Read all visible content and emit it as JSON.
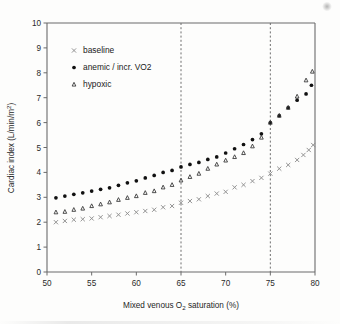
{
  "chart_data": {
    "type": "scatter",
    "title": "",
    "xlabel": "Mixed venous O2 saturation (%)",
    "ylabel": "Cardiac index (L/min/m2)",
    "xlim": [
      50,
      80
    ],
    "ylim": [
      0,
      10
    ],
    "xticks": [
      50,
      55,
      60,
      65,
      70,
      75,
      80
    ],
    "xticklabels": [
      "50",
      "55",
      "60",
      "65",
      "70",
      "75",
      "80"
    ],
    "yticks": [
      0,
      1,
      2,
      3,
      4,
      5,
      6,
      7,
      8,
      9,
      10
    ],
    "yticklabels": [
      "0",
      "1",
      "2",
      "3",
      "4",
      "5",
      "6",
      "7",
      "8",
      "9",
      "10"
    ],
    "grid": false,
    "legend_position": "upper left",
    "annotations": [
      {
        "type": "vline",
        "x": 65,
        "style": "dashed"
      },
      {
        "type": "vline",
        "x": 75,
        "style": "dashed"
      }
    ],
    "series": [
      {
        "name": "baseline",
        "marker": "x",
        "color": "#8d8d8d",
        "x": [
          51,
          52,
          53,
          54,
          55,
          56,
          57,
          58,
          59,
          60,
          61,
          62,
          63,
          64,
          65,
          66,
          67,
          68,
          69,
          70,
          71,
          72,
          73,
          74,
          75,
          76,
          77,
          78,
          78.7,
          79.3,
          79.8
        ],
        "values": [
          2.0,
          2.05,
          2.1,
          2.12,
          2.15,
          2.2,
          2.25,
          2.3,
          2.35,
          2.4,
          2.45,
          2.5,
          2.6,
          2.65,
          2.78,
          2.85,
          2.92,
          3.05,
          3.15,
          3.22,
          3.4,
          3.5,
          3.65,
          3.78,
          3.95,
          4.15,
          4.3,
          4.5,
          4.7,
          4.9,
          5.1
        ]
      },
      {
        "name": "anemic / incr. VO2",
        "marker": "filled-circle",
        "color": "#111111",
        "x": [
          51,
          52,
          53,
          54,
          55,
          56,
          57,
          58,
          59,
          60,
          61,
          62,
          63,
          64,
          65,
          66,
          67,
          68,
          69,
          70,
          71,
          72,
          73,
          74,
          75,
          76,
          77,
          78,
          79,
          79.6
        ],
        "values": [
          2.98,
          3.05,
          3.12,
          3.18,
          3.25,
          3.32,
          3.38,
          3.48,
          3.58,
          3.66,
          3.78,
          3.88,
          4.0,
          4.08,
          4.22,
          4.32,
          4.4,
          4.52,
          4.62,
          4.78,
          4.95,
          5.12,
          5.32,
          5.55,
          6.0,
          6.28,
          6.6,
          6.9,
          7.15,
          7.5
        ]
      },
      {
        "name": "hypoxic",
        "marker": "open-triangle",
        "color": "#3a3a3a",
        "x": [
          51,
          52,
          53,
          54,
          55,
          56,
          57,
          58,
          59,
          60,
          61,
          62,
          63,
          64,
          65,
          66,
          67,
          68,
          69,
          70,
          71,
          72,
          73,
          74,
          75,
          76,
          77,
          78,
          79,
          79.7
        ],
        "values": [
          2.4,
          2.42,
          2.5,
          2.55,
          2.65,
          2.72,
          2.8,
          2.9,
          2.98,
          3.05,
          3.18,
          3.25,
          3.4,
          3.5,
          3.68,
          3.82,
          3.95,
          4.15,
          4.32,
          4.48,
          4.62,
          4.78,
          5.05,
          5.4,
          6.0,
          6.28,
          6.6,
          7.05,
          7.7,
          8.05
        ]
      }
    ],
    "legend": [
      {
        "label": "baseline",
        "marker": "x"
      },
      {
        "label": "anemic / incr. VO2",
        "marker": "filled-circle"
      },
      {
        "label": "hypoxic",
        "marker": "open-triangle"
      }
    ]
  }
}
